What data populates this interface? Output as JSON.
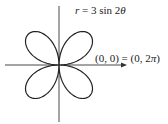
{
  "figure": {
    "equation": {
      "r": "r",
      "eq_rest": " = 3 sin 2",
      "theta": "θ"
    },
    "point_label": {
      "left": "(0, 0) = (0, 2",
      "pi": "π",
      "right": ")"
    }
  },
  "curve": {
    "type": "polar-rose",
    "expression": "r = 3 sin 2θ",
    "amplitude": 3,
    "frequency": 2,
    "petals": 4,
    "theta_range": [
      0,
      6.283185307
    ]
  },
  "colors": {
    "stroke": "#222222",
    "background": "#ffffff"
  }
}
